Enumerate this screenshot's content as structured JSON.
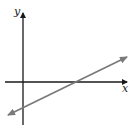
{
  "diagram": {
    "type": "coordinate-plane-line-graph",
    "axes": {
      "x_label": "x",
      "y_label": "y",
      "axis_color": "#1a1a1a"
    },
    "line": {
      "color": "#7a7a7a",
      "description": "straight line with positive slope, arrows at both ends; crosses positive x-axis and negative y-axis",
      "slope_sign": "positive",
      "x_intercept_sign": "positive",
      "y_intercept_sign": "negative"
    }
  }
}
